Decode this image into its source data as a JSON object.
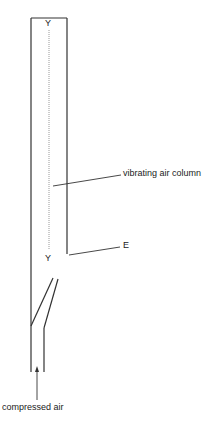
{
  "diagram": {
    "labels": {
      "top_node": "Y",
      "bottom_node": "Y",
      "air_column": "vibrating air column",
      "edge": "E",
      "inlet": "compressed air"
    },
    "colors": {
      "line": "#333333",
      "dotted": "#999999",
      "text": "#222222"
    }
  }
}
